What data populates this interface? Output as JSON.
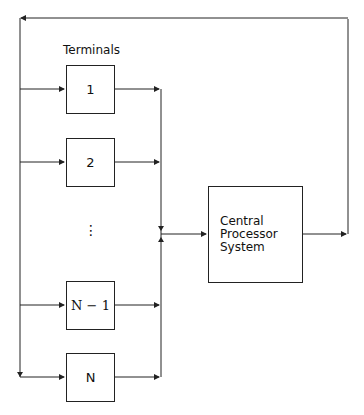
{
  "diagram": {
    "terminals_label": "Terminals",
    "terminals": [
      {
        "label": "1"
      },
      {
        "label": "2"
      },
      {
        "label": "⋮"
      },
      {
        "label": "N − 1"
      },
      {
        "label": "N"
      }
    ],
    "processor": {
      "line1": "Central",
      "line2": "Processor",
      "line3": "System"
    }
  }
}
